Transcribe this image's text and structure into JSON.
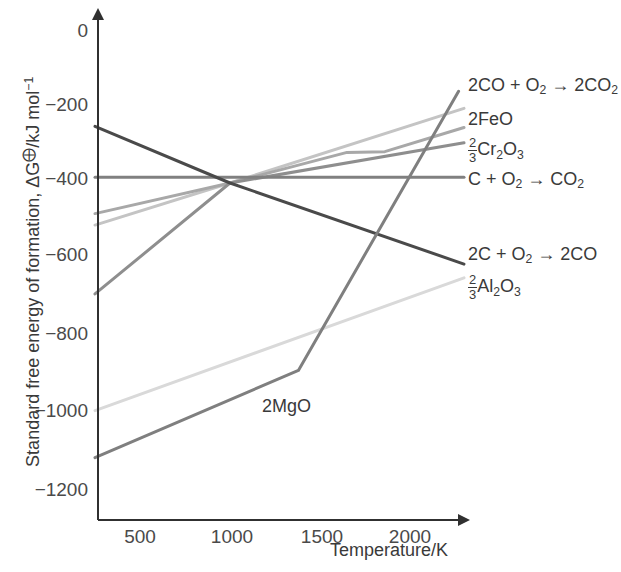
{
  "chart_data": {
    "type": "line",
    "title": "",
    "xlabel": "Temperature/K",
    "ylabel": "Standard free energy of formation, ΔG⨁/kJ mol⁻¹",
    "xlim": [
      250,
      2300
    ],
    "ylim": [
      -1300,
      30
    ],
    "xticks": [
      500,
      1000,
      1500,
      2000
    ],
    "yticks": [
      0,
      -200,
      -400,
      -600,
      -800,
      -1000,
      -1200
    ],
    "xtick_labels": [
      "500",
      "1000",
      "1500",
      "2000"
    ],
    "ytick_labels": [
      "0",
      "−200",
      "−400",
      "−600",
      "−800",
      "−1000",
      "−1200"
    ],
    "grid": false,
    "legend_position": "right-inline-labels",
    "series": [
      {
        "name": "2CO + O2 → 2CO2",
        "label_html": "2CO + O<sub>2</sub> → 2CO<sub>2</sub>",
        "color": "#c4c4c4",
        "points": [
          [
            250,
            -510
          ],
          [
            1000,
            -400
          ],
          [
            2300,
            -205
          ]
        ]
      },
      {
        "name": "2FeO",
        "label_html": "2FeO",
        "color": "#a8a8a8",
        "points": [
          [
            250,
            -480
          ],
          [
            1000,
            -400
          ],
          [
            1650,
            -320
          ],
          [
            1860,
            -318
          ],
          [
            2300,
            -255
          ]
        ]
      },
      {
        "name": "2/3 Cr2O3",
        "label_html": "<span class=\"frac\"><span class=\"num\">2</span><span class=\"den\">3</span></span>Cr<sub>2</sub>O<sub>3</sub>",
        "color": "#8e8e8e",
        "points": [
          [
            250,
            -690
          ],
          [
            1000,
            -400
          ],
          [
            2300,
            -295
          ]
        ]
      },
      {
        "name": "C + O2 → CO2",
        "label_html": "C + O<sub>2</sub> → CO<sub>2</sub>",
        "color": "#808080",
        "points": [
          [
            250,
            -385
          ],
          [
            2300,
            -385
          ]
        ]
      },
      {
        "name": "2C + O2 → 2CO",
        "label_html": "2C + O<sub>2</sub> → 2CO",
        "color": "#4a4a4a",
        "points": [
          [
            250,
            -252
          ],
          [
            1000,
            -400
          ],
          [
            2300,
            -612
          ]
        ]
      },
      {
        "name": "2/3 Al2O3",
        "label_html": "<span class=\"frac\"><span class=\"num\">2</span><span class=\"den\">3</span></span>Al<sub>2</sub>O<sub>3</sub>",
        "color": "#d9d9d9",
        "points": [
          [
            250,
            -995
          ],
          [
            2300,
            -648
          ]
        ]
      },
      {
        "name": "2MgO",
        "label_html": "2MgO",
        "color": "#7f7f7f",
        "points": [
          [
            250,
            -1118
          ],
          [
            1380,
            -890
          ],
          [
            2270,
            -160
          ]
        ]
      }
    ],
    "inline_annotations": [
      {
        "text": "2MgO",
        "x_px": 262,
        "y_px": 396
      }
    ],
    "axis_color": "#404040",
    "text_color": "#3a3a3a"
  },
  "axes": {
    "x_title": "Temperature/K",
    "y_title_parts": {
      "before": "Standard free energy of formation, ΔG",
      "symbol": "⨁",
      "after": "/kJ mol"
    },
    "y_title_exponent": "−1"
  },
  "yticks": [
    {
      "label": "0",
      "top": 20
    },
    {
      "label": "−200",
      "top": 94
    },
    {
      "label": "−400",
      "top": 168
    },
    {
      "label": "−600",
      "top": 244
    },
    {
      "label": "−800",
      "top": 323
    },
    {
      "label": "−1000",
      "top": 400
    },
    {
      "label": "−1200",
      "top": 479
    }
  ],
  "xticks": [
    {
      "label": "500",
      "left": 140
    },
    {
      "label": "1000",
      "left": 232
    },
    {
      "label": "1500",
      "left": 322
    },
    {
      "label": "2000",
      "left": 410
    }
  ],
  "series_labels": [
    {
      "id": "co-co2",
      "top": 76,
      "left": 468
    },
    {
      "id": "feo",
      "top": 110,
      "left": 468
    },
    {
      "id": "cr2o3",
      "top": 138,
      "left": 468
    },
    {
      "id": "c-co2",
      "top": 170,
      "left": 468
    },
    {
      "id": "c-co",
      "top": 245,
      "left": 468
    },
    {
      "id": "al2o3",
      "top": 275,
      "left": 468
    }
  ]
}
